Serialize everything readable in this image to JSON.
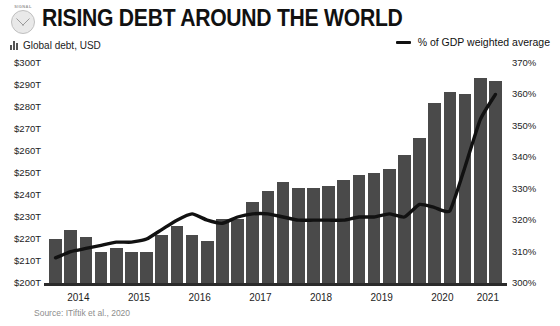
{
  "brand": {
    "tag": "SIGNAL",
    "logo_icon": "circular-emblem-logo"
  },
  "header": {
    "title": "RISING DEBT AROUND THE WORLD",
    "subtitle": "Global debt, USD",
    "subtitle_icon": "bar-chart-icon",
    "legend_icon": "line-marker-icon",
    "legend_label": "% of GDP weighted average"
  },
  "footer": {
    "source": "Source: ITiftik et al., 2020"
  },
  "colors": {
    "bar": "#4a4a4a",
    "line": "#111111",
    "axis": "#2b2b2b",
    "text": "#1d1d1d",
    "muted": "#8d8d8d"
  },
  "chart_data": {
    "type": "bar",
    "title": "RISING DEBT AROUND THE WORLD",
    "xlabel": "",
    "ylabel": "Global debt, USD",
    "y2label": "% of GDP weighted average",
    "grid": false,
    "legend_position": "top-right",
    "ylim": [
      200,
      300
    ],
    "y2lim": [
      300,
      370
    ],
    "yticks": [
      "$200T",
      "$210T",
      "$220T",
      "$230T",
      "$240T",
      "$250T",
      "$260T",
      "$270T",
      "$280T",
      "$290T",
      "$300T"
    ],
    "ytick_values": [
      200,
      210,
      220,
      230,
      240,
      250,
      260,
      270,
      280,
      290,
      300
    ],
    "y2ticks": [
      "300%",
      "310%",
      "320%",
      "330%",
      "340%",
      "350%",
      "360%",
      "370%"
    ],
    "y2tick_values": [
      300,
      310,
      320,
      330,
      340,
      350,
      360,
      370
    ],
    "xtick_labels": [
      "2014",
      "2015",
      "2016",
      "2017",
      "2018",
      "2019",
      "2020",
      "2021"
    ],
    "categories": [
      "2014 Q1",
      "2014 Q2",
      "2014 Q3",
      "2014 Q4",
      "2015 Q1",
      "2015 Q2",
      "2015 Q3",
      "2015 Q4",
      "2016 Q1",
      "2016 Q2",
      "2016 Q3",
      "2016 Q4",
      "2017 Q1",
      "2017 Q2",
      "2017 Q3",
      "2017 Q4",
      "2018 Q1",
      "2018 Q2",
      "2018 Q3",
      "2018 Q4",
      "2019 Q1",
      "2019 Q2",
      "2019 Q3",
      "2019 Q4",
      "2020 Q1",
      "2020 Q2",
      "2020 Q3",
      "2020 Q4",
      "2021 Q1",
      "2021 Q2"
    ],
    "series": [
      {
        "name": "Global debt, USD",
        "axis": "left",
        "type": "bar",
        "values": [
          220,
          224,
          221,
          214,
          216,
          214,
          214,
          222,
          226,
          222,
          219,
          229,
          229,
          237,
          242,
          246,
          243,
          243,
          244,
          247,
          249,
          250,
          252,
          258,
          266,
          282,
          287,
          286,
          293,
          292
        ]
      },
      {
        "name": "% of GDP weighted average",
        "axis": "right",
        "type": "line",
        "values": [
          308,
          310,
          311,
          312,
          313,
          313,
          314,
          317,
          320,
          322,
          320,
          319,
          321,
          322,
          322,
          321,
          320,
          320,
          320,
          320,
          321,
          321,
          322,
          321,
          325,
          324,
          323,
          337,
          352,
          360
        ]
      }
    ]
  }
}
